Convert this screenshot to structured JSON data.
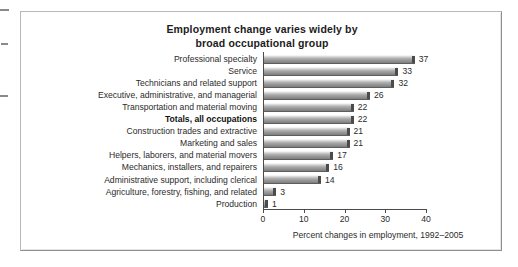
{
  "edge_marks": [
    "margin-mark-1",
    "margin-mark-2",
    "margin-mark-3"
  ],
  "chart_data": {
    "type": "bar",
    "orientation": "horizontal",
    "title": "Employment change varies widely by broad occupational group",
    "title_line1": "Employment change varies widely by",
    "title_line2": "broad occupational group",
    "xlabel": "Percent changes in employment, 1992–2005",
    "ylabel": "",
    "xlim": [
      0,
      40
    ],
    "xticks": [
      0,
      10,
      20,
      30,
      40
    ],
    "xtick_labels": [
      "0",
      "10",
      "20",
      "30",
      "40"
    ],
    "grid": false,
    "legend": false,
    "bar_color": "#a8a8a8",
    "bar_cap_color": "#4b4b4b",
    "categories": [
      "Professional specialty",
      "Service",
      "Technicians and related support",
      "Executive, administrative, and managerial",
      "Transportation and material moving",
      "Totals, all occupations",
      "Construction trades and extractive",
      "Marketing and sales",
      "Helpers, laborers, and material movers",
      "Mechanics, installers, and repairers",
      "Administrative support, including clerical",
      "Agriculture, forestry, fishing, and related",
      "Production"
    ],
    "values": [
      37,
      33,
      32,
      26,
      22,
      22,
      21,
      21,
      17,
      16,
      14,
      3,
      1
    ],
    "value_labels": [
      "37",
      "33",
      "32",
      "26",
      "22",
      "22",
      "21",
      "21",
      "17",
      "16",
      "14",
      "3",
      "1"
    ],
    "emphasized_category": "Totals, all occupations"
  }
}
